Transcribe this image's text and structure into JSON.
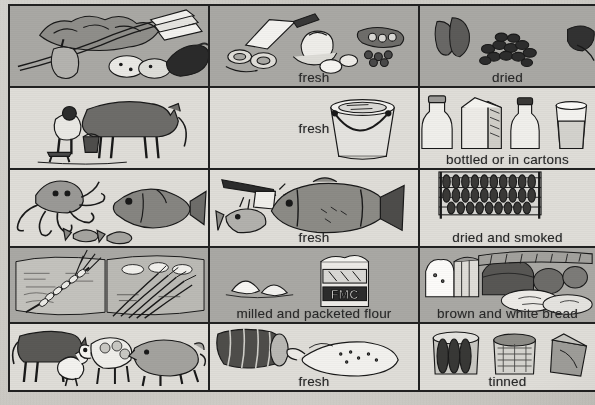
{
  "document": {
    "type": "food-groups-table",
    "columns": 3,
    "rows": 5
  },
  "colors": {
    "row_dark": "#a9a8a4",
    "row_light": "#dedcd7",
    "paper": "#cfcdc8",
    "ink": "#232323"
  },
  "grid": [
    {
      "index": 1,
      "shade": "dark",
      "cells": [
        {
          "name": "vegetables-raw",
          "label": "",
          "icon": "vegetables-illustration"
        },
        {
          "name": "vegetables-fresh",
          "label": "fresh",
          "icon": "prepared-vegetables-illustration"
        },
        {
          "name": "vegetables-dried",
          "label": "dried",
          "icon": "dried-beans-illustration"
        }
      ]
    },
    {
      "index": 2,
      "shade": "light",
      "cells": [
        {
          "name": "milk-source",
          "label": "",
          "icon": "cow-milking-illustration"
        },
        {
          "name": "milk-fresh",
          "label": "fresh",
          "icon": "milk-bucket-illustration"
        },
        {
          "name": "milk-bottled",
          "label": "bottled or in cartons",
          "icon": "milk-bottles-illustration"
        }
      ]
    },
    {
      "index": 3,
      "shade": "light",
      "cells": [
        {
          "name": "fish-source",
          "label": "",
          "icon": "octopus-fish-illustration"
        },
        {
          "name": "fish-fresh",
          "label": "fresh",
          "icon": "cut-fish-illustration"
        },
        {
          "name": "fish-dried-smoked",
          "label": "dried and smoked",
          "icon": "drying-rack-illustration"
        }
      ]
    },
    {
      "index": 4,
      "shade": "dark",
      "cells": [
        {
          "name": "cereal-source",
          "label": "",
          "icon": "wheat-rice-field-illustration"
        },
        {
          "name": "cereal-flour",
          "label": "milled and packeted flour",
          "icon": "flour-packet-illustration"
        },
        {
          "name": "cereal-bread",
          "label": "brown and white bread",
          "icon": "bread-loaves-illustration"
        }
      ]
    },
    {
      "index": 5,
      "shade": "light",
      "cells": [
        {
          "name": "meat-source",
          "label": "",
          "icon": "livestock-illustration"
        },
        {
          "name": "meat-fresh",
          "label": "fresh",
          "icon": "meat-joint-poultry-illustration"
        },
        {
          "name": "meat-tinned",
          "label": "tinned",
          "icon": "tinned-meat-illustration"
        }
      ]
    }
  ],
  "labels": {
    "fresh": "fresh",
    "dried": "dried",
    "bottled_or_in_cartons": "bottled or in cartons",
    "dried_and_smoked": "dried and smoked",
    "milled_and_packeted_flour": "milled and packeted flour",
    "brown_and_white_bread": "brown and white bread",
    "tinned": "tinned"
  },
  "packaging_text": {
    "flour_packet_brand": "FMC"
  }
}
